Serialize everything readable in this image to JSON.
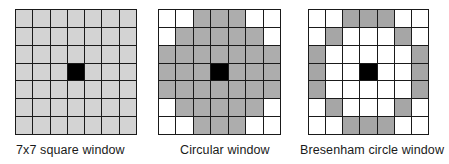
{
  "colors": {
    "white": "#ffffff",
    "light_gray": "#d3d3d3",
    "mid_gray": "#adadad",
    "dark_gray": "#a6a6a6",
    "center": "#000000",
    "grid_line": "#1a1a1a"
  },
  "legend_codes": {
    "W": "empty cell",
    "G": "window cell",
    "B": "center pixel"
  },
  "panels": [
    {
      "label": "7x7 square window",
      "fill_color_key": "light_gray",
      "rows": [
        "GGGGGGG",
        "GGGGGGG",
        "GGGGGGG",
        "GGGBGGG",
        "GGGGGGG",
        "GGGGGGG",
        "GGGGGGG"
      ]
    },
    {
      "label": "Circular window",
      "fill_color_key": "mid_gray",
      "rows": [
        "WWGGGWW",
        "WGGGGGW",
        "GGGGGGG",
        "GGGBGGG",
        "GGGGGGG",
        "WGGGGGW",
        "WWGGGWW"
      ]
    },
    {
      "label": "Bresenham circle window",
      "fill_color_key": "dark_gray",
      "rows": [
        "WWGGGWW",
        "WGWWWGW",
        "GWWWWWG",
        "GWWBWWG",
        "GWWWWWG",
        "WGWWWGW",
        "WWGGGWW"
      ]
    }
  ]
}
